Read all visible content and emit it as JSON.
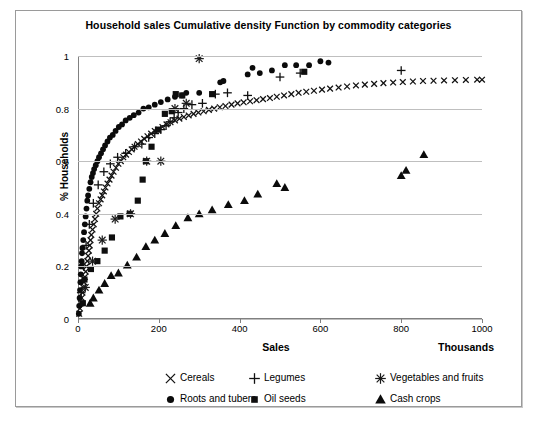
{
  "chart_data": {
    "type": "scatter",
    "title": "Household sales Cumulative density Function by commodity categories",
    "xlabel": "Sales",
    "xunits": "Thousands",
    "ylabel": "% Households",
    "xlim": [
      0,
      1000
    ],
    "ylim": [
      0,
      1
    ],
    "xticks": [
      0,
      200,
      400,
      600,
      800,
      1000
    ],
    "yticks": [
      0,
      0.2,
      0.4,
      0.6,
      0.8,
      1
    ],
    "grid": "horizontal",
    "legend_position": "bottom",
    "series": [
      {
        "name": "Cereals",
        "marker": "x",
        "color": "#111111",
        "points": [
          [
            3,
            0.02
          ],
          [
            5,
            0.04
          ],
          [
            7,
            0.06
          ],
          [
            9,
            0.08
          ],
          [
            11,
            0.1
          ],
          [
            13,
            0.12
          ],
          [
            15,
            0.14
          ],
          [
            17,
            0.16
          ],
          [
            19,
            0.18
          ],
          [
            21,
            0.2
          ],
          [
            23,
            0.22
          ],
          [
            25,
            0.24
          ],
          [
            27,
            0.26
          ],
          [
            29,
            0.28
          ],
          [
            31,
            0.3
          ],
          [
            33,
            0.32
          ],
          [
            36,
            0.34
          ],
          [
            39,
            0.36
          ],
          [
            42,
            0.38
          ],
          [
            45,
            0.4
          ],
          [
            48,
            0.42
          ],
          [
            52,
            0.44
          ],
          [
            56,
            0.455
          ],
          [
            60,
            0.47
          ],
          [
            64,
            0.485
          ],
          [
            68,
            0.5
          ],
          [
            73,
            0.515
          ],
          [
            78,
            0.53
          ],
          [
            83,
            0.545
          ],
          [
            88,
            0.56
          ],
          [
            94,
            0.575
          ],
          [
            100,
            0.59
          ],
          [
            106,
            0.6
          ],
          [
            112,
            0.615
          ],
          [
            119,
            0.625
          ],
          [
            126,
            0.635
          ],
          [
            133,
            0.645
          ],
          [
            140,
            0.655
          ],
          [
            148,
            0.665
          ],
          [
            156,
            0.675
          ],
          [
            164,
            0.685
          ],
          [
            172,
            0.695
          ],
          [
            181,
            0.705
          ],
          [
            190,
            0.715
          ],
          [
            199,
            0.72
          ],
          [
            209,
            0.73
          ],
          [
            219,
            0.74
          ],
          [
            229,
            0.748
          ],
          [
            240,
            0.755
          ],
          [
            251,
            0.762
          ],
          [
            262,
            0.768
          ],
          [
            274,
            0.774
          ],
          [
            286,
            0.78
          ],
          [
            298,
            0.785
          ],
          [
            311,
            0.79
          ],
          [
            324,
            0.795
          ],
          [
            337,
            0.8
          ],
          [
            351,
            0.805
          ],
          [
            365,
            0.81
          ],
          [
            380,
            0.815
          ],
          [
            395,
            0.82
          ],
          [
            410,
            0.824
          ],
          [
            426,
            0.828
          ],
          [
            442,
            0.832
          ],
          [
            458,
            0.836
          ],
          [
            475,
            0.84
          ],
          [
            492,
            0.845
          ],
          [
            510,
            0.85
          ],
          [
            528,
            0.855
          ],
          [
            546,
            0.86
          ],
          [
            565,
            0.864
          ],
          [
            584,
            0.868
          ],
          [
            604,
            0.872
          ],
          [
            624,
            0.876
          ],
          [
            645,
            0.88
          ],
          [
            666,
            0.884
          ],
          [
            688,
            0.888
          ],
          [
            710,
            0.891
          ],
          [
            733,
            0.894
          ],
          [
            756,
            0.897
          ],
          [
            780,
            0.899
          ],
          [
            804,
            0.901
          ],
          [
            829,
            0.903
          ],
          [
            854,
            0.905
          ],
          [
            880,
            0.906
          ],
          [
            906,
            0.907
          ],
          [
            933,
            0.908
          ],
          [
            960,
            0.909
          ],
          [
            988,
            0.91
          ],
          [
            1000,
            0.91
          ]
        ]
      },
      {
        "name": "Roots and tubers",
        "marker": "circle",
        "color": "#0b0b0b",
        "points": [
          [
            2,
            0.02
          ],
          [
            3,
            0.05
          ],
          [
            4,
            0.08
          ],
          [
            5,
            0.11
          ],
          [
            6,
            0.14
          ],
          [
            7,
            0.17
          ],
          [
            8,
            0.2
          ],
          [
            9,
            0.22
          ],
          [
            10,
            0.25
          ],
          [
            11,
            0.27
          ],
          [
            13,
            0.3
          ],
          [
            15,
            0.33
          ],
          [
            17,
            0.36
          ],
          [
            19,
            0.39
          ],
          [
            21,
            0.42
          ],
          [
            23,
            0.45
          ],
          [
            25,
            0.47
          ],
          [
            28,
            0.495
          ],
          [
            31,
            0.52
          ],
          [
            34,
            0.54
          ],
          [
            37,
            0.555
          ],
          [
            40,
            0.57
          ],
          [
            44,
            0.585
          ],
          [
            48,
            0.6
          ],
          [
            52,
            0.615
          ],
          [
            57,
            0.63
          ],
          [
            62,
            0.645
          ],
          [
            67,
            0.66
          ],
          [
            73,
            0.675
          ],
          [
            79,
            0.69
          ],
          [
            86,
            0.7
          ],
          [
            93,
            0.715
          ],
          [
            101,
            0.73
          ],
          [
            109,
            0.74
          ],
          [
            118,
            0.755
          ],
          [
            128,
            0.765
          ],
          [
            138,
            0.775
          ],
          [
            150,
            0.785
          ],
          [
            162,
            0.8
          ],
          [
            175,
            0.805
          ],
          [
            190,
            0.815
          ],
          [
            205,
            0.825
          ],
          [
            222,
            0.835
          ],
          [
            240,
            0.845
          ],
          [
            258,
            0.85
          ],
          [
            268,
            0.86
          ],
          [
            300,
            0.86
          ],
          [
            352,
            0.9
          ],
          [
            360,
            0.905
          ],
          [
            420,
            0.93
          ],
          [
            432,
            0.955
          ],
          [
            450,
            0.935
          ],
          [
            480,
            0.945
          ],
          [
            512,
            0.965
          ],
          [
            540,
            0.965
          ],
          [
            572,
            0.965
          ],
          [
            600,
            0.98
          ],
          [
            620,
            0.975
          ]
        ]
      },
      {
        "name": "Legumes",
        "marker": "plus",
        "color": "#111111",
        "points": [
          [
            8,
            0.1
          ],
          [
            14,
            0.2
          ],
          [
            20,
            0.28
          ],
          [
            28,
            0.36
          ],
          [
            38,
            0.44
          ],
          [
            50,
            0.51
          ],
          [
            64,
            0.56
          ],
          [
            80,
            0.59
          ],
          [
            98,
            0.615
          ],
          [
            118,
            0.63
          ],
          [
            140,
            0.655
          ],
          [
            158,
            0.665
          ],
          [
            175,
            0.69
          ],
          [
            190,
            0.705
          ],
          [
            205,
            0.72
          ],
          [
            218,
            0.735
          ],
          [
            228,
            0.75
          ],
          [
            238,
            0.765
          ],
          [
            248,
            0.785
          ],
          [
            262,
            0.8
          ],
          [
            282,
            0.815
          ],
          [
            308,
            0.82
          ],
          [
            340,
            0.855
          ],
          [
            370,
            0.86
          ],
          [
            420,
            0.85
          ],
          [
            500,
            0.92
          ],
          [
            550,
            0.935
          ],
          [
            800,
            0.945
          ]
        ]
      },
      {
        "name": "Oil seeds",
        "marker": "square",
        "color": "#0f0f0f",
        "points": [
          [
            12,
            0.06
          ],
          [
            16,
            0.15
          ],
          [
            32,
            0.19
          ],
          [
            48,
            0.22
          ],
          [
            66,
            0.26
          ],
          [
            84,
            0.31
          ],
          [
            105,
            0.39
          ],
          [
            128,
            0.4
          ],
          [
            148,
            0.45
          ],
          [
            160,
            0.53
          ],
          [
            168,
            0.6
          ],
          [
            182,
            0.655
          ],
          [
            198,
            0.72
          ],
          [
            215,
            0.78
          ],
          [
            232,
            0.79
          ],
          [
            242,
            0.855
          ],
          [
            258,
            0.85
          ],
          [
            332,
            0.855
          ],
          [
            560,
            0.94
          ]
        ]
      },
      {
        "name": "Vegetables and fruits",
        "marker": "star",
        "color": "#1a1a1a",
        "points": [
          [
            18,
            0.12
          ],
          [
            36,
            0.22
          ],
          [
            60,
            0.3
          ],
          [
            92,
            0.38
          ],
          [
            130,
            0.4
          ],
          [
            170,
            0.6
          ],
          [
            205,
            0.6
          ],
          [
            240,
            0.8
          ],
          [
            268,
            0.82
          ],
          [
            300,
            0.99
          ]
        ]
      },
      {
        "name": "Cash crops",
        "marker": "triangle",
        "color": "#0b0b0b",
        "points": [
          [
            30,
            0.06
          ],
          [
            38,
            0.08
          ],
          [
            52,
            0.11
          ],
          [
            66,
            0.135
          ],
          [
            82,
            0.165
          ],
          [
            100,
            0.175
          ],
          [
            122,
            0.205
          ],
          [
            145,
            0.235
          ],
          [
            168,
            0.275
          ],
          [
            190,
            0.3
          ],
          [
            215,
            0.325
          ],
          [
            242,
            0.355
          ],
          [
            272,
            0.385
          ],
          [
            300,
            0.4
          ],
          [
            332,
            0.415
          ],
          [
            372,
            0.435
          ],
          [
            412,
            0.45
          ],
          [
            445,
            0.475
          ],
          [
            492,
            0.515
          ],
          [
            512,
            0.5
          ],
          [
            800,
            0.545
          ],
          [
            812,
            0.565
          ],
          [
            856,
            0.625
          ]
        ]
      }
    ]
  },
  "legend": {
    "items": [
      {
        "label": "Cereals",
        "marker": "x"
      },
      {
        "label": "Roots and tubers",
        "marker": "circle"
      },
      {
        "label": "Legumes",
        "marker": "plus"
      },
      {
        "label": "Oil seeds",
        "marker": "square"
      },
      {
        "label": "Vegetables and fruits",
        "marker": "star"
      },
      {
        "label": "Cash crops",
        "marker": "triangle"
      }
    ]
  }
}
